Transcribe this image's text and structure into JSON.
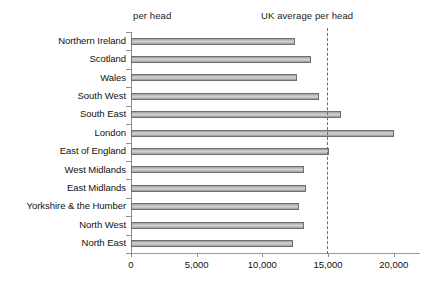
{
  "chart_data": {
    "type": "bar",
    "orientation": "horizontal",
    "title": "",
    "xlabel": "",
    "ylabel": "",
    "xlim": [
      0,
      22000
    ],
    "grid": false,
    "categories": [
      "Northern Ireland",
      "Scotland",
      "Wales",
      "South West",
      "South East",
      "London",
      "East of England",
      "West Midlands",
      "East Midlands",
      "Yorkshire & the Humber",
      "North West",
      "North East"
    ],
    "values": [
      12500,
      13700,
      12600,
      14300,
      16000,
      20000,
      15100,
      13200,
      13300,
      12800,
      13200,
      12300
    ],
    "xticks": [
      0,
      5000,
      10000,
      15000,
      20000
    ],
    "xtick_labels": [
      "0",
      "5,000",
      "10,000",
      "15,000",
      "20,000"
    ],
    "annotations": [
      {
        "name": "per-head",
        "text": "per head",
        "value": null
      },
      {
        "name": "uk-average-per-head",
        "text": "UK average per head",
        "value": 14900
      }
    ],
    "reference_line": {
      "label": "UK average per head",
      "value": 14900,
      "style": "dashed"
    },
    "colors": {
      "bar_fill_light": "#d2d2d2",
      "bar_fill_dark": "#9a9a9a",
      "bar_border": "#6f6f6f",
      "axis": "#8d8d8d",
      "reference_line": "#6d6d6d",
      "text": "#111111",
      "background": "#ffffff"
    }
  }
}
